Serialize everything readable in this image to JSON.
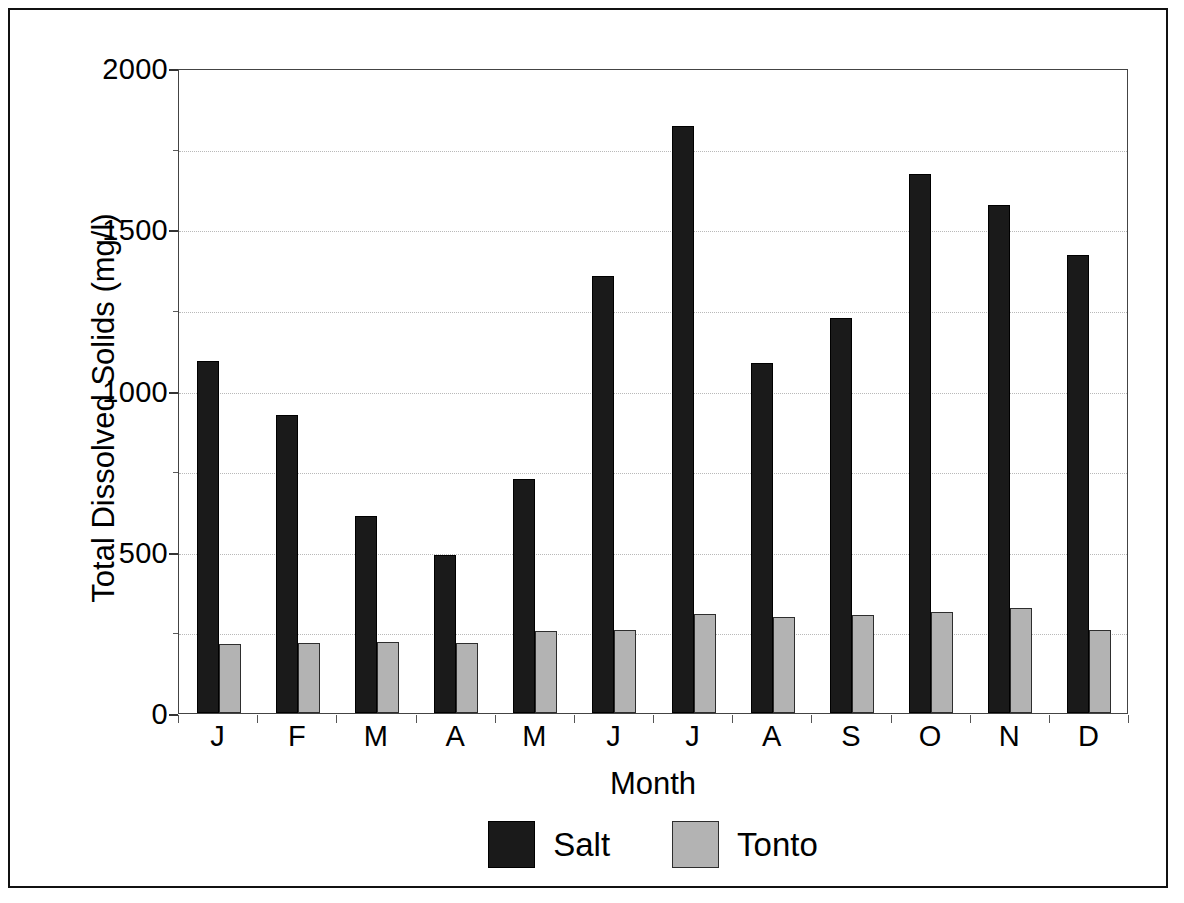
{
  "chart_data": {
    "type": "bar",
    "title": "",
    "xlabel": "Month",
    "ylabel": "Total Dissolved Solids (mg/l)",
    "categories": [
      "J",
      "F",
      "M",
      "A",
      "M",
      "J",
      "J",
      "A",
      "S",
      "O",
      "N",
      "D"
    ],
    "series": [
      {
        "name": "Salt",
        "color": "#1a1a1a",
        "values": [
          1090,
          925,
          610,
          490,
          725,
          1355,
          1820,
          1085,
          1225,
          1670,
          1575,
          1420
        ]
      },
      {
        "name": "Tonto",
        "color": "#b3b3b3",
        "values": [
          215,
          218,
          220,
          218,
          255,
          258,
          308,
          298,
          305,
          312,
          325,
          258
        ]
      }
    ],
    "ylim": [
      0,
      2000
    ],
    "y_ticks": [
      0,
      500,
      1000,
      1500,
      2000
    ],
    "y_tick_labels": [
      "0",
      "500",
      "1000",
      "1500",
      "2000"
    ],
    "y_minor_ticks": [
      250,
      750,
      1250,
      1750
    ],
    "gridlines": [
      250,
      500,
      750,
      1000,
      1250,
      1500,
      1750
    ],
    "grid": true,
    "grid_style": "dotted",
    "legend_position": "bottom-center",
    "legend": [
      "Salt",
      "Tonto"
    ]
  },
  "axes": {
    "y_title": "Total Dissolved Solids (mg/l)",
    "x_title": "Month"
  },
  "legend": {
    "entries": [
      {
        "label": "Salt",
        "swatch": "salt-swatch"
      },
      {
        "label": "Tonto",
        "swatch": "tonto-swatch"
      }
    ]
  }
}
